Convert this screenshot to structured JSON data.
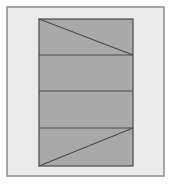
{
  "diagram": {
    "canvas": {
      "width": 174,
      "height": 184,
      "background": "#ffffff"
    },
    "frame": {
      "x": 7,
      "y": 7,
      "width": 157,
      "height": 169,
      "fill": "#ebebeb",
      "stroke": "#8c8c8c",
      "stroke_width": 1.5
    },
    "rect": {
      "x": 39,
      "y": 19,
      "width": 94,
      "height": 147,
      "fill": "#a9a9a9",
      "stroke": "#4a4a4a",
      "stroke_width": 1.2
    },
    "horizontal_lines_y": [
      55,
      91,
      128
    ],
    "diagonals": [
      {
        "from": [
          39,
          19
        ],
        "to": [
          133,
          55
        ]
      },
      {
        "from": [
          39,
          166
        ],
        "to": [
          133,
          128
        ]
      }
    ],
    "line_color": "#4a4a4a"
  }
}
